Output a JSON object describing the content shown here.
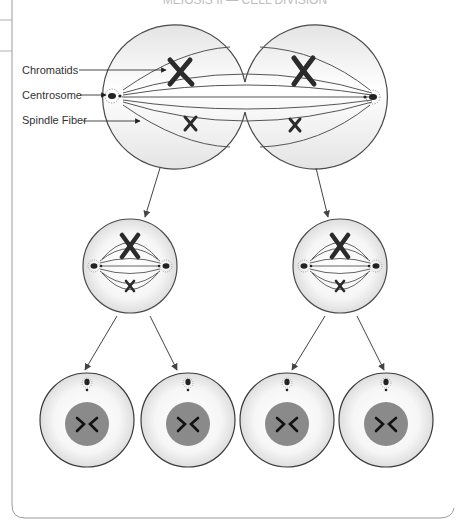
{
  "diagram": {
    "title_partial": "MEIOSIS II — CELL DIVISION",
    "type": "biology-cell-division",
    "colors": {
      "outline": "#4a4a4a",
      "cell_fill_center": "#ffffff",
      "cell_fill_edge": "#dcdcdc",
      "chromosome": "#2b2b2b",
      "nucleus": "#8a8a8a",
      "frame": "#9a9a9a",
      "arrow": "#444444"
    },
    "labels": [
      {
        "id": "chromatids",
        "text": "Chromatids"
      },
      {
        "id": "centrosome",
        "text": "Centrosome"
      },
      {
        "id": "spindle-fiber",
        "text": "Spindle Fiber"
      }
    ],
    "stages": [
      {
        "name": "parent-cell",
        "count": 1,
        "description": "Dividing cell with spindle fibers, two centrosomes, two pairs of chromatids"
      },
      {
        "name": "metaphase-cells",
        "count": 2,
        "description": "Two cells each with spindle, centrosomes, and chromatids"
      },
      {
        "name": "daughter-cells",
        "count": 4,
        "description": "Four cells each with a nucleus and centrosome"
      }
    ]
  }
}
